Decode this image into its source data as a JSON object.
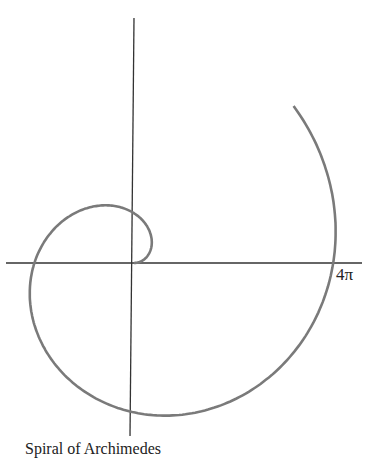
{
  "caption": "Spiral of Archimedes",
  "axis_label": "4π",
  "chart_data": {
    "type": "line",
    "title": "Spiral of Archimedes",
    "equation": "r = θ (polar)",
    "theta_range": [
      0,
      7.07
    ],
    "annotations": [
      {
        "text": "4π",
        "position": "positive x-axis intercept"
      }
    ],
    "origin_px": [
      134,
      263
    ],
    "px_per_unit": 31.7
  },
  "colors": {
    "curve": "#7a7a7a",
    "axes": "#333333"
  }
}
